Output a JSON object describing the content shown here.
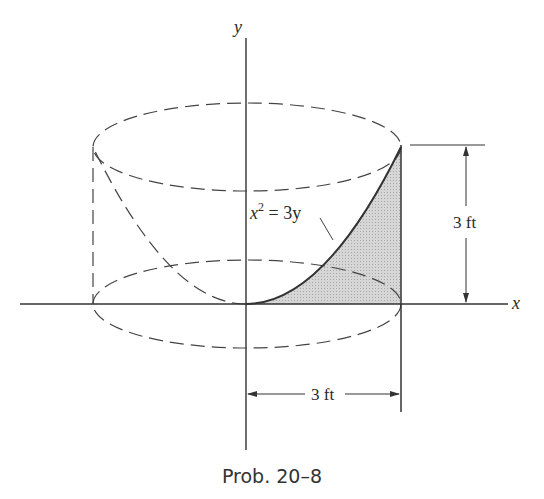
{
  "figure": {
    "axis_x_label": "x",
    "axis_y_label": "y",
    "curve_label_base": "x",
    "curve_label_exp": "2",
    "curve_label_rest": " = 3y",
    "height_dim_label": "3 ft",
    "radius_dim_label": "3 ft",
    "shade_color": "#c8c8c8",
    "line_color": "#333333"
  },
  "caption": "Prob. 20–8"
}
